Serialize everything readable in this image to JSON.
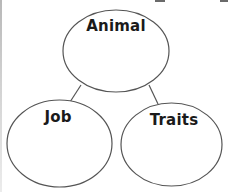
{
  "diagram": {
    "type": "concept-map",
    "colors": {
      "stroke": "#555555",
      "text": "#1a1a1a",
      "background": "#ffffff"
    },
    "nodes": [
      {
        "id": "animal",
        "label": "Animal"
      },
      {
        "id": "job",
        "label": "Job"
      },
      {
        "id": "traits",
        "label": "Traits"
      }
    ],
    "edges": [
      {
        "from": "animal",
        "to": "job"
      },
      {
        "from": "animal",
        "to": "traits"
      }
    ]
  }
}
